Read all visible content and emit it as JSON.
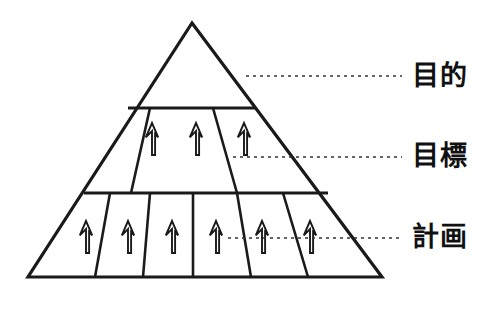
{
  "diagram": {
    "type": "pyramid-hierarchy",
    "title": "",
    "background_color": "#ffffff",
    "line_color": "#1a1a1a",
    "text_color": "#111111",
    "geometry": {
      "apex": [
        192,
        23
      ],
      "base_left": [
        28,
        277
      ],
      "base_right": [
        382,
        277
      ],
      "tier_divider_y": [
        108,
        193
      ]
    },
    "tiers": [
      {
        "id": "tier-top",
        "label": "目的",
        "cell_count": 1,
        "arrow_count": 0,
        "y_range": [
          23,
          108
        ],
        "leader": {
          "y": 76,
          "x_start": 246,
          "x_end": 402
        }
      },
      {
        "id": "tier-middle",
        "label": "目標",
        "cell_count": 3,
        "arrow_count": 3,
        "y_range": [
          108,
          193
        ],
        "leader": {
          "y": 157,
          "x_start": 233,
          "x_end": 402
        }
      },
      {
        "id": "tier-bottom",
        "label": "計画",
        "cell_count": 6,
        "arrow_count": 6,
        "y_range": [
          193,
          277
        ],
        "leader": {
          "y": 238,
          "x_start": 228,
          "x_end": 402
        }
      }
    ],
    "arrow_icon_name": "up-arrow-outline-icon",
    "arrow_direction": "up"
  },
  "labels": {
    "purpose": "目的",
    "goal": "目標",
    "plan": "計画"
  }
}
